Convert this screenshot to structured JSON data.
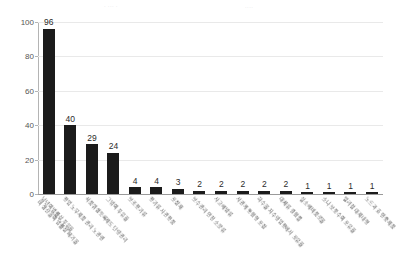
{
  "artifacts": {
    "top_left_smudge": "· ··· ·",
    "top_right_smudge": "····"
  },
  "chart_data": {
    "type": "bar",
    "title": "",
    "subtitle": "",
    "xlabel": "",
    "ylabel": "",
    "ylim": [
      0,
      100
    ],
    "yticks": [
      0,
      20,
      40,
      60,
      80,
      100
    ],
    "ytick_labels": [
      "0",
      "20",
      "40",
      "60",
      "80",
      "100"
    ],
    "grid": true,
    "grid_axis": "y",
    "legend": false,
    "legend_position": "none",
    "bar_color": "#1b1b1b",
    "value_labels_shown": true,
    "categories": [
      "남년의법률상 푸유율\n비 생산물의 법률상 페기물",
      "용입 노무제품 관리 노관련",
      "식품위생등록제도 단량관리",
      "그밖의 푸유율",
      "보조용기류",
      "용기류 사관용품",
      "포장재",
      "보수관리 안전 소분류",
      "사고예방류",
      "서관계 통합형 포장",
      "하수물 처수영업용에서 포유율",
      "대체류 결합를",
      "실소예비품로물",
      "소나 보풍수의 포유율",
      "일러정 대제내형",
      "노드과 효 인중제품"
    ],
    "values": [
      96,
      40,
      29,
      24,
      4,
      4,
      3,
      2,
      2,
      2,
      2,
      2,
      1,
      1,
      1,
      1
    ]
  }
}
